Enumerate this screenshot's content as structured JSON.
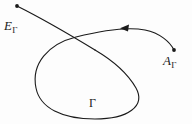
{
  "figure": {
    "kind": "mathematical-curve-diagram",
    "background_color": "#fdfdfd",
    "stroke_color": "#1a1a1a",
    "stroke_width": 1.1,
    "width": 192,
    "height": 124
  },
  "labels": {
    "entry": {
      "symbol": "E",
      "subscript": "Γ",
      "full": "EΓ"
    },
    "exit": {
      "symbol": "A",
      "subscript": "Γ",
      "full": "AΓ"
    },
    "curve": {
      "symbol": "Γ",
      "full": "Γ"
    }
  },
  "markers": {
    "entry_dot": {
      "x": 17,
      "y": 6,
      "r": 1.9
    },
    "exit_dot": {
      "x": 174,
      "y": 50,
      "r": 1.9
    },
    "arrow": {
      "x": 126,
      "y": 28,
      "direction": "left",
      "name": "orientation-arrowhead"
    }
  },
  "paths": {
    "entry_segment": "M17,6 C 45,20 72,36 95,50",
    "loop_and_tail": "M95,50 C 112,60 128,74 136,88 C 146,106 128,119 95,119 C 62,119 40,108 36,88 C 31,64 48,44 76,37 C 104,30 130,27 145,30 C 160,33 170,42 174,50",
    "note": "entry_segment runs from the E-dot down-right, crossing the loop; loop_and_tail continues as the closed lobe and exits toward the A-dot"
  }
}
